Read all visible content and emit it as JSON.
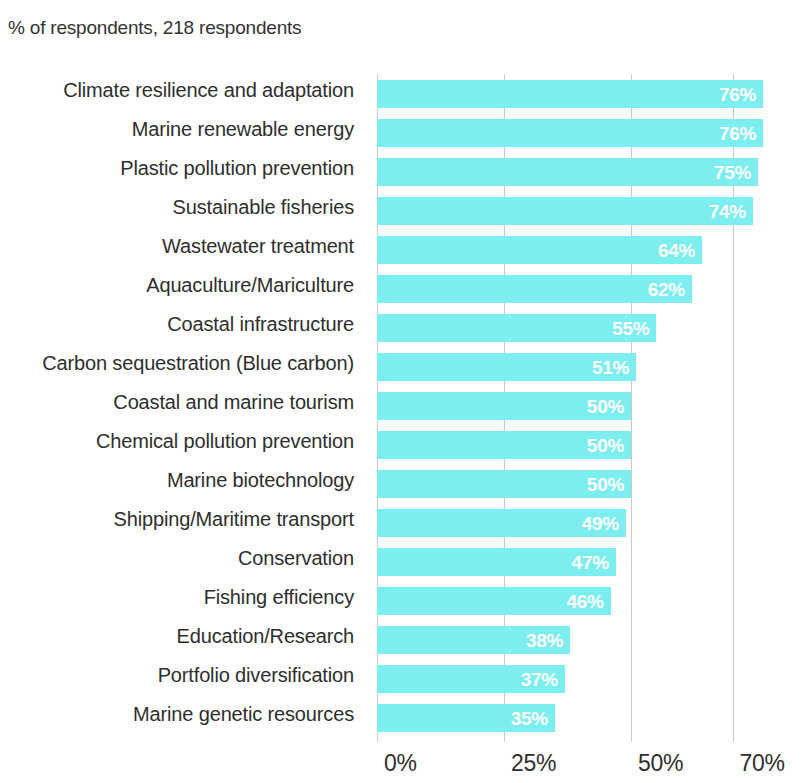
{
  "header": {
    "subtitle": "% of respondents, 218 respondents"
  },
  "axis": {
    "ticks": [
      "0%",
      "25%",
      "50%",
      "70%"
    ]
  },
  "colors": {
    "bar": "#7CEEF0",
    "value_label": "#FFFFFF",
    "gridline": "#C9C9C9",
    "text": "#2E2E2E",
    "background": "#FFFFFF"
  },
  "chart_data": {
    "type": "bar",
    "orientation": "horizontal",
    "title": "",
    "subtitle": "% of respondents, 218 respondents",
    "xlabel": "",
    "ylabel": "",
    "xlim": [
      0,
      76
    ],
    "grid": true,
    "legend": "none",
    "xtick_labels": [
      "0%",
      "25%",
      "50%",
      "70%"
    ],
    "xtick_values": [
      0,
      25,
      50,
      70
    ],
    "value_suffix": "%",
    "categories": [
      "Climate resilience and adaptation",
      "Marine renewable energy",
      "Plastic pollution prevention",
      "Sustainable fisheries",
      "Wastewater treatment",
      "Aquaculture/Mariculture",
      "Coastal infrastructure",
      "Carbon sequestration (Blue carbon)",
      "Coastal and marine tourism",
      "Chemical pollution prevention",
      "Marine biotechnology",
      "Shipping/Maritime transport",
      "Conservation",
      "Fishing efficiency",
      "Education/Research",
      "Portfolio diversification",
      "Marine genetic resources"
    ],
    "values": [
      76,
      76,
      75,
      74,
      64,
      62,
      55,
      51,
      50,
      50,
      50,
      49,
      47,
      46,
      38,
      37,
      35
    ],
    "value_labels": [
      "76%",
      "76%",
      "75%",
      "74%",
      "64%",
      "62%",
      "55%",
      "51%",
      "50%",
      "50%",
      "50%",
      "49%",
      "47%",
      "46%",
      "38%",
      "37%",
      "35%"
    ]
  }
}
